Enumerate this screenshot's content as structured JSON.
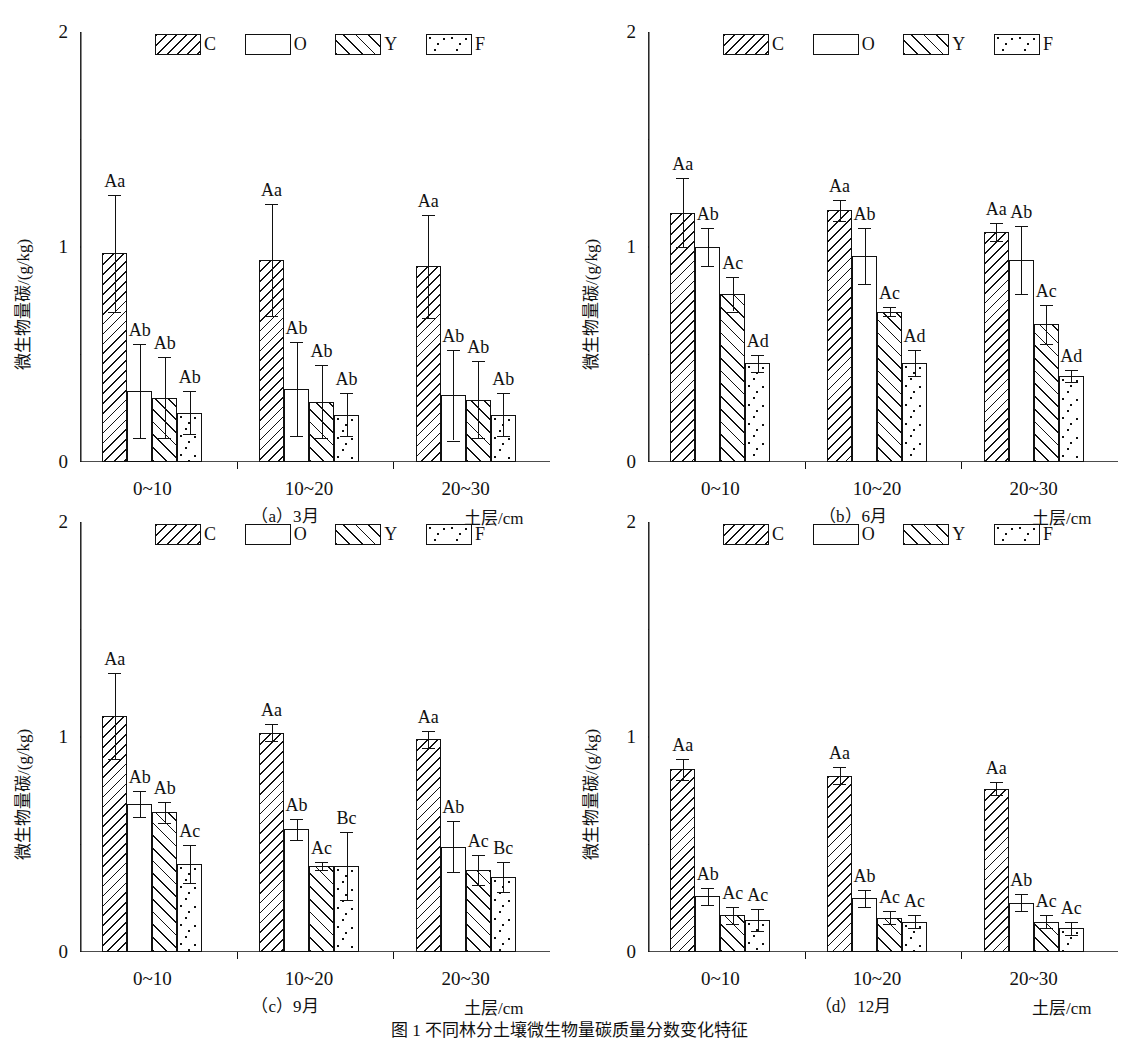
{
  "figure": {
    "caption": "图 1  不同林分土壤微生物量碳质量分数变化特征",
    "y_axis_label": "微生物量碳/(g/kg)",
    "x_axis_label": "土层/cm",
    "y_ticks": [
      "0",
      "1",
      "2"
    ],
    "y_minor_ticks": [
      0.5,
      1.5
    ],
    "ylim": [
      0,
      2
    ],
    "x_categories": [
      "0~10",
      "10~20",
      "20~30"
    ],
    "legend": [
      {
        "key": "C",
        "label": "C",
        "pattern": "back-hatch"
      },
      {
        "key": "O",
        "label": "O",
        "pattern": "empty"
      },
      {
        "key": "Y",
        "label": "Y",
        "pattern": "forward-hatch"
      },
      {
        "key": "F",
        "label": "F",
        "pattern": "dotted"
      }
    ]
  },
  "chart_data": [
    {
      "id": "a",
      "type": "bar",
      "title": "（a）3月",
      "xlabel": "土层/cm",
      "ylabel": "微生物量碳/(g/kg)",
      "ylim": [
        0,
        2
      ],
      "grid": false,
      "legend_position": "top-center",
      "categories": [
        "0~10",
        "10~20",
        "20~30"
      ],
      "series": [
        {
          "name": "C",
          "values": [
            0.97,
            0.94,
            0.91
          ],
          "errors": [
            0.27,
            0.26,
            0.24
          ],
          "labels": [
            "Aa",
            "Aa",
            "Aa"
          ]
        },
        {
          "name": "O",
          "values": [
            0.33,
            0.34,
            0.31
          ],
          "errors": [
            0.22,
            0.22,
            0.21
          ],
          "labels": [
            "Ab",
            "Ab",
            "Ab"
          ]
        },
        {
          "name": "Y",
          "values": [
            0.3,
            0.28,
            0.29
          ],
          "errors": [
            0.19,
            0.17,
            0.18
          ],
          "labels": [
            "Ab",
            "Ab",
            "Ab"
          ]
        },
        {
          "name": "F",
          "values": [
            0.23,
            0.22,
            0.22
          ],
          "errors": [
            0.1,
            0.1,
            0.1
          ],
          "labels": [
            "Ab",
            "Ab",
            "Ab"
          ]
        }
      ]
    },
    {
      "id": "b",
      "type": "bar",
      "title": "（b）6月",
      "xlabel": "土层/cm",
      "ylabel": "微生物量碳/(g/kg)",
      "ylim": [
        0,
        2
      ],
      "grid": false,
      "legend_position": "top-center",
      "categories": [
        "0~10",
        "10~20",
        "20~30"
      ],
      "series": [
        {
          "name": "C",
          "values": [
            1.16,
            1.17,
            1.07
          ],
          "errors": [
            0.16,
            0.05,
            0.04
          ],
          "labels": [
            "Aa",
            "Aa",
            "Aa"
          ]
        },
        {
          "name": "O",
          "values": [
            1.0,
            0.96,
            0.94
          ],
          "errors": [
            0.09,
            0.13,
            0.16
          ],
          "labels": [
            "Ab",
            "Ab",
            "Ab"
          ]
        },
        {
          "name": "Y",
          "values": [
            0.78,
            0.7,
            0.64
          ],
          "errors": [
            0.08,
            0.02,
            0.09
          ],
          "labels": [
            "Ac",
            "Ac",
            "Ac"
          ]
        },
        {
          "name": "F",
          "values": [
            0.46,
            0.46,
            0.4
          ],
          "errors": [
            0.04,
            0.06,
            0.03
          ],
          "labels": [
            "Ad",
            "Ad",
            "Ad"
          ]
        }
      ]
    },
    {
      "id": "c",
      "type": "bar",
      "title": "（c）9月",
      "xlabel": "土层/cm",
      "ylabel": "微生物量碳/(g/kg)",
      "ylim": [
        0,
        2
      ],
      "grid": false,
      "legend_position": "top-center",
      "categories": [
        "0~10",
        "10~20",
        "20~30"
      ],
      "series": [
        {
          "name": "C",
          "values": [
            1.1,
            1.02,
            0.99
          ],
          "errors": [
            0.2,
            0.04,
            0.04
          ],
          "labels": [
            "Aa",
            "Aa",
            "Aa"
          ]
        },
        {
          "name": "O",
          "values": [
            0.69,
            0.57,
            0.49
          ],
          "errors": [
            0.06,
            0.05,
            0.12
          ],
          "labels": [
            "Ab",
            "Ab",
            "Ab"
          ]
        },
        {
          "name": "Y",
          "values": [
            0.65,
            0.4,
            0.38
          ],
          "errors": [
            0.05,
            0.02,
            0.07
          ],
          "labels": [
            "Ab",
            "Ac",
            "Ac"
          ]
        },
        {
          "name": "F",
          "values": [
            0.41,
            0.4,
            0.35
          ],
          "errors": [
            0.09,
            0.16,
            0.07
          ],
          "labels": [
            "Ac",
            "Bc",
            "Bc"
          ]
        }
      ]
    },
    {
      "id": "d",
      "type": "bar",
      "title": "（d）12月",
      "xlabel": "土层/cm",
      "ylabel": "微生物量碳/(g/kg)",
      "ylim": [
        0,
        2
      ],
      "grid": false,
      "legend_position": "top-center",
      "categories": [
        "0~10",
        "10~20",
        "20~30"
      ],
      "series": [
        {
          "name": "C",
          "values": [
            0.85,
            0.82,
            0.76
          ],
          "errors": [
            0.05,
            0.04,
            0.03
          ],
          "labels": [
            "Aa",
            "Aa",
            "Aa"
          ]
        },
        {
          "name": "O",
          "values": [
            0.26,
            0.25,
            0.23
          ],
          "errors": [
            0.04,
            0.04,
            0.04
          ],
          "labels": [
            "Ab",
            "Ab",
            "Ab"
          ]
        },
        {
          "name": "Y",
          "values": [
            0.17,
            0.16,
            0.14
          ],
          "errors": [
            0.04,
            0.03,
            0.03
          ],
          "labels": [
            "Ac",
            "Ac",
            "Ac"
          ]
        },
        {
          "name": "F",
          "values": [
            0.15,
            0.14,
            0.11
          ],
          "errors": [
            0.05,
            0.03,
            0.03
          ],
          "labels": [
            "Ac",
            "Ac",
            "Ac"
          ]
        }
      ]
    }
  ]
}
